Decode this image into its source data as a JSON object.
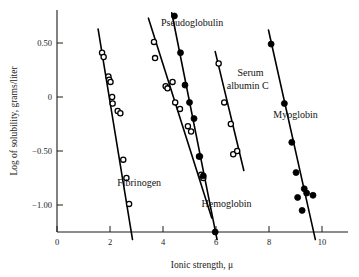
{
  "figure": {
    "background": "#ffffff",
    "ink_color": "#000000"
  },
  "axes": {
    "x": {
      "label": "Ionic strength, μ",
      "ticks": [
        "0",
        "2",
        "4",
        "6",
        "8",
        "10"
      ],
      "tick_values": [
        0,
        2,
        4,
        6,
        8,
        10
      ],
      "range": [
        0,
        10.6
      ]
    },
    "y": {
      "label": "Log of solubility, grams/liter",
      "ticks": [
        "0.50",
        "0",
        "−0.50",
        "−1.00"
      ],
      "tick_values": [
        0.5,
        0,
        -0.5,
        -1.0
      ],
      "range": [
        -1.32,
        0.78
      ]
    }
  },
  "chart_data": {
    "type": "scatter",
    "title": "",
    "subtitle": "",
    "xlabel": "Ionic strength, μ",
    "ylabel": "Log of solubility, grams/liter",
    "xlim": [
      0,
      10.6
    ],
    "ylim": [
      -1.32,
      0.78
    ],
    "grid": false,
    "legend": "inline-annotations",
    "annotations": [
      {
        "text": "Fibrinogen",
        "x": 3.1,
        "y": -0.82
      },
      {
        "text": "Pseudoglobulin",
        "x": 5.1,
        "y": 0.66
      },
      {
        "text": "Serum",
        "x": 7.3,
        "y": 0.19
      },
      {
        "text": "albumin C",
        "x": 7.2,
        "y": 0.07
      },
      {
        "text": "Hemoglobin",
        "x": 6.4,
        "y": -1.02
      },
      {
        "text": "Myoglobin",
        "x": 9.0,
        "y": -0.19
      }
    ],
    "series": [
      {
        "name": "Fibrinogen",
        "marker": "open-circle",
        "x": [
          1.7,
          1.76,
          1.94,
          1.97,
          2.02,
          2.08,
          2.1,
          2.29,
          2.39,
          2.5,
          2.62,
          2.72
        ],
        "y": [
          0.41,
          0.37,
          0.19,
          0.16,
          0.14,
          0.0,
          -0.06,
          -0.13,
          -0.15,
          -0.58,
          -0.75,
          -0.99
        ],
        "fit_line": {
          "x": [
            1.55,
            2.85
          ],
          "y": [
            0.63,
            -1.32
          ]
        }
      },
      {
        "name": "Hemoglobin",
        "marker": "open-circle",
        "x": [
          3.66,
          3.7,
          4.1,
          4.17,
          4.36,
          4.46,
          4.64,
          4.94,
          5.06,
          5.36,
          5.44,
          5.52
        ],
        "y": [
          0.51,
          0.36,
          0.1,
          0.08,
          0.14,
          -0.05,
          -0.11,
          -0.27,
          -0.32,
          -0.55,
          -0.72,
          -0.75
        ],
        "fit_line": {
          "x": [
            3.45,
            5.84
          ],
          "y": [
            0.73,
            -1.12
          ]
        }
      },
      {
        "name": "Pseudoglobulin",
        "marker": "filled-circle",
        "x": [
          4.43,
          4.66,
          4.83,
          5.0,
          5.17,
          5.39,
          5.52,
          5.97
        ],
        "y": [
          0.75,
          0.41,
          0.11,
          -0.05,
          -0.2,
          -0.55,
          -0.73,
          -1.25
        ],
        "fit_line": {
          "x": [
            4.33,
            6.04
          ],
          "y": [
            0.78,
            -1.32
          ]
        }
      },
      {
        "name": "Serum albumin C",
        "marker": "open-circle",
        "x": [
          6.1,
          6.31,
          6.56,
          6.65,
          6.8
        ],
        "y": [
          0.31,
          -0.05,
          -0.25,
          -0.53,
          -0.5
        ],
        "fit_line": {
          "x": [
            5.97,
            7.05
          ],
          "y": [
            0.42,
            -0.68
          ]
        }
      },
      {
        "name": "Myoglobin",
        "marker": "filled-circle",
        "x": [
          8.08,
          8.58,
          8.86,
          9.02,
          9.08,
          9.25,
          9.33,
          9.42,
          9.66
        ],
        "y": [
          0.49,
          -0.06,
          -0.42,
          -0.7,
          -0.93,
          -1.05,
          -0.85,
          -0.89,
          -0.91
        ],
        "fit_line": {
          "x": [
            7.98,
            9.75
          ],
          "y": [
            0.62,
            -1.32
          ]
        }
      }
    ]
  }
}
